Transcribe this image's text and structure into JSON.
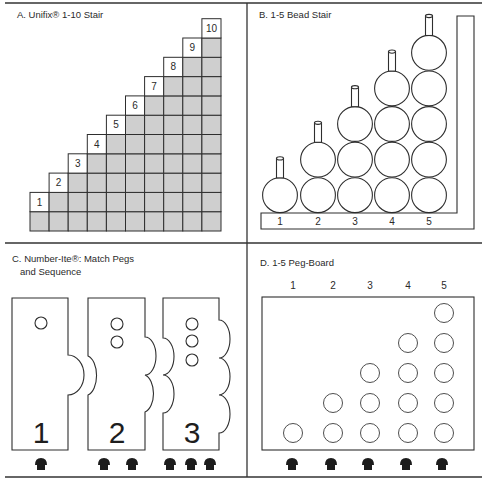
{
  "figure": {
    "panels": {
      "a": {
        "title": "A. Unifix® 1-10 Stair",
        "columns": 10,
        "labels": [
          "1",
          "2",
          "3",
          "4",
          "5",
          "6",
          "7",
          "8",
          "9",
          "10"
        ],
        "cell_fill": "#cfcfcf"
      },
      "b": {
        "title": "B. 1-5 Bead Stair",
        "columns": 5,
        "labels": [
          "1",
          "2",
          "3",
          "4",
          "5"
        ],
        "beads_per_column": [
          1,
          2,
          3,
          4,
          5
        ]
      },
      "c": {
        "title_line1": "C. Number-Ite®: Match Pegs",
        "title_line2": "and Sequence",
        "cards": [
          {
            "numeral": "1",
            "holes": 1,
            "pegs": 1
          },
          {
            "numeral": "2",
            "holes": 2,
            "pegs": 2
          },
          {
            "numeral": "3",
            "holes": 3,
            "pegs": 3
          }
        ]
      },
      "d": {
        "title": "D. 1-5 Peg-Board",
        "labels": [
          "1",
          "2",
          "3",
          "4",
          "5"
        ],
        "holes_per_column": [
          1,
          2,
          3,
          4,
          5
        ],
        "pegs": 5
      }
    }
  }
}
